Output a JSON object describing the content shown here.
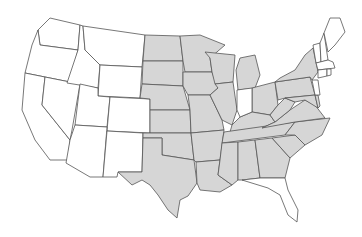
{
  "map": {
    "title": "",
    "colors": {
      "highlight": "#d6d6d6",
      "default": "#ffffff",
      "border": "#555555"
    },
    "highlighted_states": [
      "ND",
      "SD",
      "NE",
      "KS",
      "OK",
      "TX",
      "MN",
      "IA",
      "MO",
      "AR",
      "LA",
      "WI",
      "IL",
      "MI",
      "OH",
      "KY",
      "TN",
      "MS",
      "AL",
      "GA",
      "SC",
      "NC",
      "VA",
      "WV",
      "PA",
      "NY",
      "MD",
      "DE"
    ],
    "unhighlighted_states": [
      "WA",
      "OR",
      "CA",
      "NV",
      "ID",
      "MT",
      "WY",
      "UT",
      "CO",
      "AZ",
      "NM",
      "IN",
      "FL",
      "NJ",
      "ME",
      "NH",
      "VT",
      "MA",
      "CT",
      "RI"
    ]
  }
}
